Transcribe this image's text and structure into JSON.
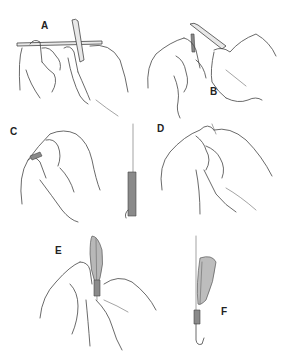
{
  "figure": {
    "type": "instructional line illustration",
    "background_color": "#ffffff",
    "line_color": "#444444",
    "steps": [
      {
        "label": "A",
        "description": "two hands holding a thin rod/shank with thread, one hand holding a tool"
      },
      {
        "label": "B",
        "description": "hands holding a tool vertical against the rod, thread wrapped"
      },
      {
        "label": "C",
        "description": "hands pinching the shank tip; separate shaded shank with hook point at right"
      },
      {
        "label": "D",
        "description": "two hands clasped wrapping thread at top"
      },
      {
        "label": "E",
        "description": "hands holding a feather against the shank while wrapping"
      },
      {
        "label": "F",
        "description": "finished hook with feather tied on, thread wraps near bend"
      }
    ]
  }
}
